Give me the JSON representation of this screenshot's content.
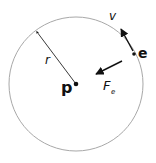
{
  "diagram": {
    "type": "atom-orbit",
    "labels": {
      "proton": "p",
      "electron": "e",
      "radius": "r",
      "velocity": "v",
      "force": "F",
      "force_subscript": "e"
    },
    "colors": {
      "orbit": "#a8a8a8",
      "ink": "#111111"
    }
  }
}
